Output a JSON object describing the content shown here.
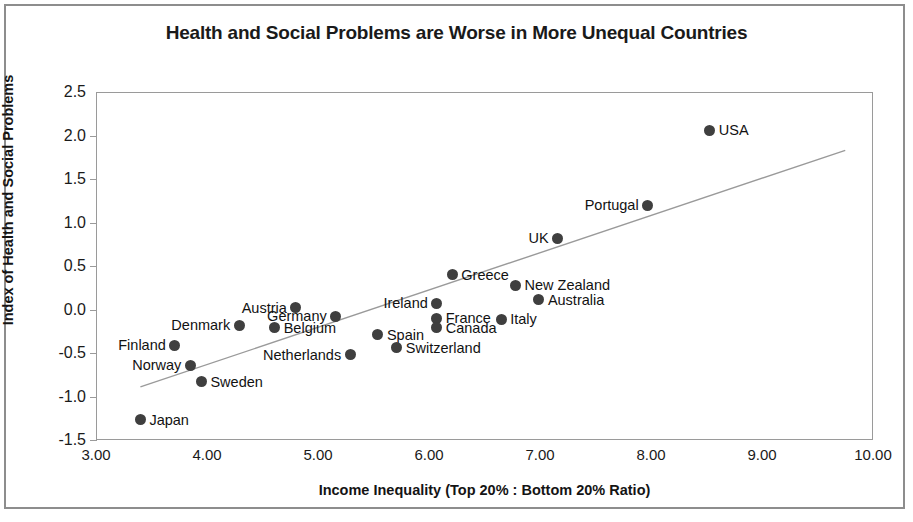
{
  "chart_data": {
    "type": "scatter",
    "title": "Health and Social Problems are Worse in More Unequal Countries",
    "xlabel": "Income Inequality (Top 20% : Bottom 20% Ratio)",
    "ylabel": "Index of Health and Social Problems",
    "xlim": [
      3.0,
      10.0
    ],
    "ylim": [
      -1.5,
      2.5
    ],
    "xticks": [
      "3.00",
      "4.00",
      "5.00",
      "6.00",
      "7.00",
      "8.00",
      "9.00",
      "10.00"
    ],
    "yticks": [
      "2.5",
      "2.0",
      "1.5",
      "1.0",
      "0.5",
      "0.0",
      "-0.5",
      "-1.0",
      "-1.5"
    ],
    "grid": false,
    "legend": "none",
    "marker_color": "#3f3f3f",
    "trendline": {
      "visible": true,
      "x_start": 3.4,
      "y_start": -0.89,
      "x_end": 9.75,
      "y_end": 1.83,
      "color": "#9a9a9a"
    },
    "points": [
      {
        "label": "Japan",
        "x": 3.4,
        "y": -1.27,
        "label_side": "right"
      },
      {
        "label": "Finland",
        "x": 3.71,
        "y": -0.41,
        "label_side": "left"
      },
      {
        "label": "Norway",
        "x": 3.85,
        "y": -0.64,
        "label_side": "left"
      },
      {
        "label": "Sweden",
        "x": 3.95,
        "y": -0.83,
        "label_side": "right"
      },
      {
        "label": "Denmark",
        "x": 4.29,
        "y": -0.18,
        "label_side": "left"
      },
      {
        "label": "Belgium",
        "x": 4.61,
        "y": -0.21,
        "label_side": "right"
      },
      {
        "label": "Austria",
        "x": 4.8,
        "y": 0.02,
        "label_side": "left"
      },
      {
        "label": "Germany",
        "x": 5.16,
        "y": -0.08,
        "label_side": "left"
      },
      {
        "label": "Netherlands",
        "x": 5.29,
        "y": -0.52,
        "label_side": "left"
      },
      {
        "label": "Spain",
        "x": 5.54,
        "y": -0.29,
        "label_side": "right"
      },
      {
        "label": "Switzerland",
        "x": 5.71,
        "y": -0.44,
        "label_side": "right"
      },
      {
        "label": "Ireland",
        "x": 6.07,
        "y": 0.07,
        "label_side": "left"
      },
      {
        "label": "France",
        "x": 6.07,
        "y": -0.1,
        "label_side": "right"
      },
      {
        "label": "Canada",
        "x": 6.07,
        "y": -0.21,
        "label_side": "right"
      },
      {
        "label": "Greece",
        "x": 6.21,
        "y": 0.4,
        "label_side": "right"
      },
      {
        "label": "New Zealand",
        "x": 6.78,
        "y": 0.28,
        "label_side": "right"
      },
      {
        "label": "Australia",
        "x": 6.99,
        "y": 0.11,
        "label_side": "right"
      },
      {
        "label": "Italy",
        "x": 6.65,
        "y": -0.11,
        "label_side": "right"
      },
      {
        "label": "UK",
        "x": 7.16,
        "y": 0.82,
        "label_side": "left"
      },
      {
        "label": "Portugal",
        "x": 7.97,
        "y": 1.2,
        "label_side": "left"
      },
      {
        "label": "USA",
        "x": 8.53,
        "y": 2.06,
        "label_side": "right"
      }
    ]
  }
}
